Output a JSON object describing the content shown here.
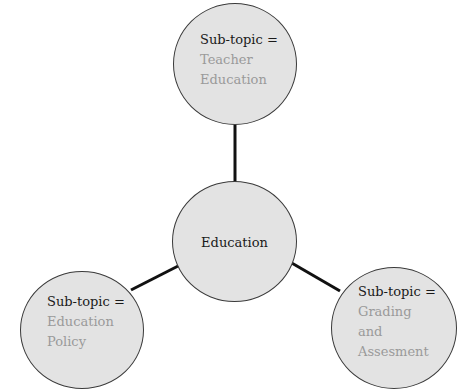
{
  "diagram": {
    "type": "mind-map",
    "center": {
      "label": "Education"
    },
    "nodes": [
      {
        "id": "top",
        "prefix": "Sub-topic =",
        "lines": [
          "Teacher",
          "Education"
        ]
      },
      {
        "id": "left",
        "prefix": "Sub-topic =",
        "lines": [
          "Education",
          "Policy"
        ]
      },
      {
        "id": "right",
        "prefix": "Sub-topic =",
        "lines": [
          "Grading",
          "and",
          "Assesment"
        ]
      }
    ],
    "edges": [
      {
        "from": "Education",
        "to": "Teacher Education"
      },
      {
        "from": "Education",
        "to": "Education Policy"
      },
      {
        "from": "Education",
        "to": "Grading and Assesment"
      }
    ],
    "colors": {
      "node_fill": "#e3e3e3",
      "node_stroke": "#3a3a3a",
      "edge": "#111111",
      "prefix_text": "#1a1a1a",
      "topic_text": "#9a9a9a"
    }
  }
}
